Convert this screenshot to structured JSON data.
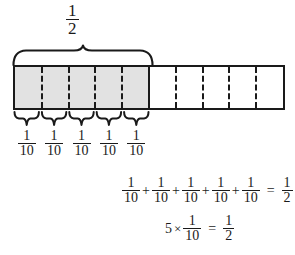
{
  "diagram": {
    "background_color": "#ffffff",
    "line_color": "#1a1a1a",
    "shaded_color": "#e2e2e2"
  },
  "top_label": {
    "numerator": "1",
    "denominator": "2"
  },
  "bar": {
    "total_cells": 10,
    "shaded_cells": 5,
    "cells": [
      {
        "index": 1,
        "shaded": true
      },
      {
        "index": 2,
        "shaded": true
      },
      {
        "index": 3,
        "shaded": true
      },
      {
        "index": 4,
        "shaded": true
      },
      {
        "index": 5,
        "shaded": true
      },
      {
        "index": 6,
        "shaded": false
      },
      {
        "index": 7,
        "shaded": false
      },
      {
        "index": 8,
        "shaded": false
      },
      {
        "index": 9,
        "shaded": false
      },
      {
        "index": 10,
        "shaded": false
      }
    ]
  },
  "tenth_labels": [
    {
      "numerator": "1",
      "denominator": "10"
    },
    {
      "numerator": "1",
      "denominator": "10"
    },
    {
      "numerator": "1",
      "denominator": "10"
    },
    {
      "numerator": "1",
      "denominator": "10"
    },
    {
      "numerator": "1",
      "denominator": "10"
    }
  ],
  "equation_sum": {
    "terms": [
      {
        "numerator": "1",
        "denominator": "10"
      },
      {
        "numerator": "1",
        "denominator": "10"
      },
      {
        "numerator": "1",
        "denominator": "10"
      },
      {
        "numerator": "1",
        "denominator": "10"
      },
      {
        "numerator": "1",
        "denominator": "10"
      }
    ],
    "plus": "+",
    "equals": "=",
    "result": {
      "numerator": "1",
      "denominator": "2"
    }
  },
  "equation_multiply": {
    "multiplier": "5",
    "times": "×",
    "factor": {
      "numerator": "1",
      "denominator": "10"
    },
    "equals": "=",
    "result": {
      "numerator": "1",
      "denominator": "2"
    }
  }
}
